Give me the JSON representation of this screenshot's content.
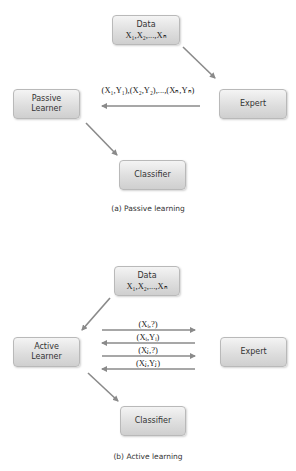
{
  "passive": {
    "data_box": {
      "title": "Data",
      "values": "X₁,X₂,...,Xₙ"
    },
    "learner_box": {
      "line1": "Passive",
      "line2": "Learner"
    },
    "expert_box": {
      "label": "Expert"
    },
    "classifier_box": {
      "label": "Classifier"
    },
    "labeled_pairs": "(X₁,Y₁),(X₂,Y₂),...,(Xₙ,Yₙ)",
    "caption": "(a) Passive learning"
  },
  "active": {
    "data_box": {
      "title": "Data",
      "values": "X₁,X₂,...,Xₙ"
    },
    "learner_box": {
      "line1": "Active",
      "line2": "Learner"
    },
    "expert_box": {
      "label": "Expert"
    },
    "classifier_box": {
      "label": "Classifier"
    },
    "exchanges": [
      {
        "label": "(Xᵢ,?)",
        "direction": "to-expert"
      },
      {
        "label": "(Xᵢ,Yᵢ)",
        "direction": "to-learner"
      },
      {
        "label": "(Xⱼ,?)",
        "direction": "to-expert"
      },
      {
        "label": "(Xⱼ,Yⱼ)",
        "direction": "to-learner"
      }
    ],
    "caption": "(b) Active learning"
  },
  "colors": {
    "arrow": "#8a8a8a",
    "box_border": "#b9b9b9"
  }
}
